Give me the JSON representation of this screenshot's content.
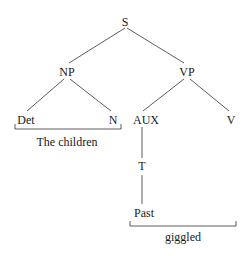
{
  "tree": {
    "root": "S",
    "nodes": {
      "s": "S",
      "np": "NP",
      "vp": "VP",
      "det": "Det",
      "n": "N",
      "aux": "AUX",
      "v": "V",
      "t": "T",
      "past": "Past"
    },
    "brackets": {
      "np_words": "The children",
      "v_words": "giggled"
    },
    "edges": [
      [
        "S",
        "NP"
      ],
      [
        "S",
        "VP"
      ],
      [
        "NP",
        "Det"
      ],
      [
        "NP",
        "N"
      ],
      [
        "VP",
        "AUX"
      ],
      [
        "VP",
        "V"
      ],
      [
        "AUX",
        "T"
      ],
      [
        "T",
        "Past"
      ]
    ],
    "line_color": "#333333"
  }
}
